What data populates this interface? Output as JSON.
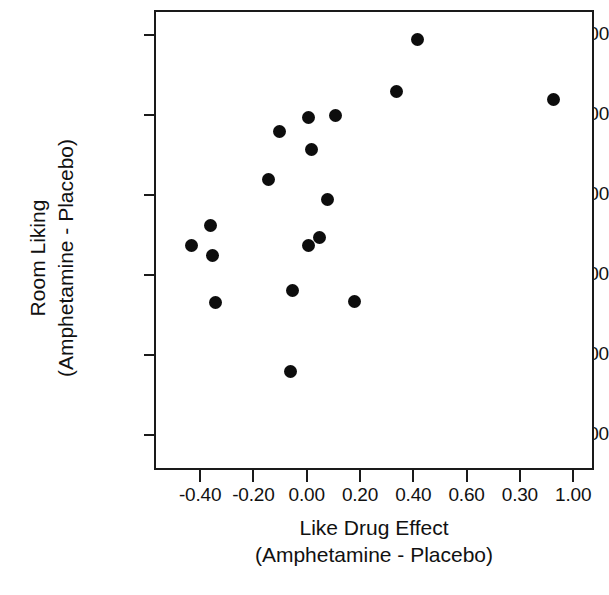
{
  "chart_data": {
    "type": "scatter",
    "title": "",
    "xlabel": "Like Drug Effect (Amphetamine - Placebo)",
    "ylabel": "Room Liking (Amphetamine - Placebo)",
    "xlabel_lines": [
      "Like Drug Effect",
      "(Amphetamine - Placebo)"
    ],
    "ylabel_lines": [
      "Room Liking",
      "(Amphetamine - Placebo)"
    ],
    "grid": false,
    "legend": null,
    "xlim": [
      -0.54,
      1.08
    ],
    "ylim": [
      -62.5,
      46.3
    ],
    "xticks": [
      -0.4,
      -0.2,
      0.0,
      0.2,
      0.4,
      0.6,
      0.8,
      1.0
    ],
    "xticklabels": [
      "-0.40",
      "-0.20",
      "0.00",
      "0.20",
      "0.40",
      "0.60",
      "0.30",
      "1.00"
    ],
    "yticks": [
      40,
      20,
      0,
      -20,
      -40,
      -60
    ],
    "yticklabels": [
      "40.00",
      "20.00",
      "0.00",
      "-20.00",
      "-40.00",
      "-50.00"
    ],
    "marker": "filled-circle",
    "marker_color": "#0d0d0d",
    "marker_size_px": 13,
    "n_points": 18,
    "x": [
      0.41,
      0.33,
      0.92,
      0.0,
      0.1,
      -0.11,
      0.01,
      -0.15,
      0.07,
      -0.37,
      0.04,
      0.0,
      -0.44,
      -0.36,
      -0.06,
      -0.35,
      0.17,
      -0.07
    ],
    "y": [
      39.5,
      26.5,
      24.3,
      20.0,
      20.5,
      16.3,
      12.0,
      4.3,
      -0.5,
      -7.0,
      -10.0,
      -12.0,
      -12.0,
      -14.5,
      -23.3,
      -26.3,
      -26.0,
      -43.5
    ],
    "points": [
      {
        "x": 0.41,
        "y": 39.5
      },
      {
        "x": 0.33,
        "y": 26.5
      },
      {
        "x": 0.92,
        "y": 24.3
      },
      {
        "x": 0.0,
        "y": 20.0
      },
      {
        "x": 0.1,
        "y": 20.5
      },
      {
        "x": -0.11,
        "y": 16.3
      },
      {
        "x": 0.01,
        "y": 12.0
      },
      {
        "x": -0.15,
        "y": 4.3
      },
      {
        "x": 0.07,
        "y": -0.5
      },
      {
        "x": -0.37,
        "y": -7.0
      },
      {
        "x": 0.04,
        "y": -10.0
      },
      {
        "x": 0.0,
        "y": -12.0
      },
      {
        "x": -0.44,
        "y": -12.0
      },
      {
        "x": -0.36,
        "y": -14.5
      },
      {
        "x": -0.06,
        "y": -23.3
      },
      {
        "x": -0.35,
        "y": -26.3
      },
      {
        "x": 0.17,
        "y": -26.0
      },
      {
        "x": -0.07,
        "y": -43.5
      }
    ]
  }
}
